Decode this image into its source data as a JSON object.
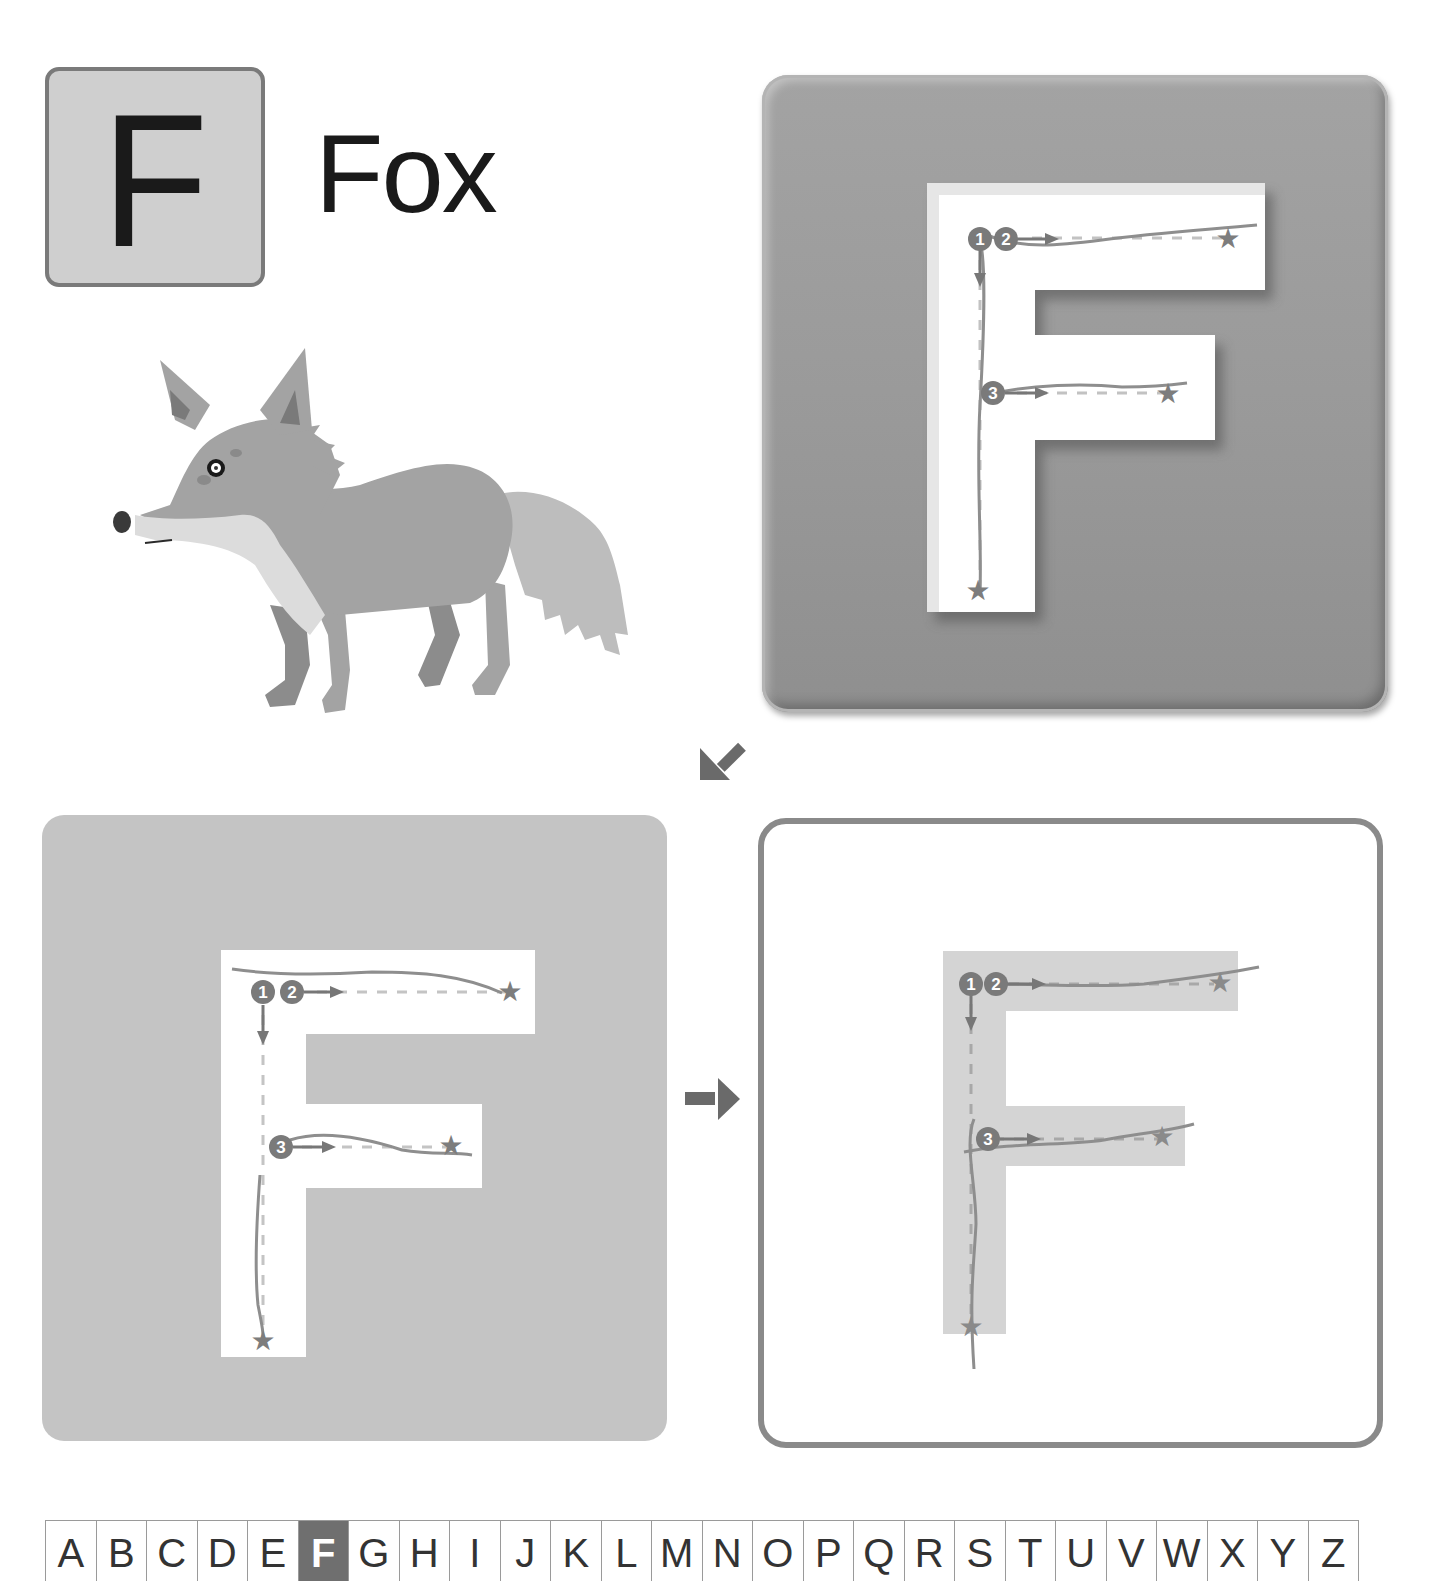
{
  "header": {
    "letter": "F",
    "word": "Fox"
  },
  "illustration": {
    "subject": "fox",
    "icon": "fox-illustration"
  },
  "colors": {
    "card_bg": "#cfcfcf",
    "card_border": "#7a7a7a",
    "panel_gray": "#c4c4c4",
    "panel_bevel": "#9a9a9a",
    "panel_border": "#8a8a8a",
    "letter_fill_light": "#d4d4d4",
    "stroke_guide": "#7d7d7d",
    "dash_guide": "#bdbdbd",
    "active_cell": "#6f6f6f"
  },
  "panels": [
    {
      "name": "trace-embossed",
      "letter": "F",
      "strokes": [
        {
          "order": "1",
          "direction": "down",
          "end_icon": "star-icon"
        },
        {
          "order": "2",
          "direction": "right",
          "end_icon": "star-icon"
        },
        {
          "order": "3",
          "direction": "right",
          "end_icon": "star-icon"
        }
      ]
    },
    {
      "name": "trace-flat",
      "letter": "F",
      "strokes": [
        {
          "order": "1",
          "direction": "down",
          "end_icon": "star-icon"
        },
        {
          "order": "2",
          "direction": "right",
          "end_icon": "star-icon"
        },
        {
          "order": "3",
          "direction": "right",
          "end_icon": "star-icon"
        }
      ]
    },
    {
      "name": "trace-outline",
      "letter": "F",
      "strokes": [
        {
          "order": "1",
          "direction": "down",
          "end_icon": "star-icon"
        },
        {
          "order": "2",
          "direction": "right",
          "end_icon": "star-icon"
        },
        {
          "order": "3",
          "direction": "right",
          "end_icon": "star-icon"
        }
      ]
    }
  ],
  "arrows": {
    "step1_to_step2": "arrow-down-left-icon",
    "step2_to_step3": "arrow-right-icon"
  },
  "alphabet": {
    "active": "F",
    "letters": [
      "A",
      "B",
      "C",
      "D",
      "E",
      "F",
      "G",
      "H",
      "I",
      "J",
      "K",
      "L",
      "M",
      "N",
      "O",
      "P",
      "Q",
      "R",
      "S",
      "T",
      "U",
      "V",
      "W",
      "X",
      "Y",
      "Z"
    ]
  }
}
